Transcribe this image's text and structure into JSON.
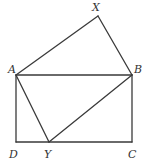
{
  "diagram": {
    "type": "geometry",
    "points": {
      "A": {
        "x": 16,
        "y": 75
      },
      "B": {
        "x": 132,
        "y": 75
      },
      "C": {
        "x": 132,
        "y": 142
      },
      "D": {
        "x": 16,
        "y": 142
      },
      "X": {
        "x": 98,
        "y": 16
      },
      "Y": {
        "x": 49,
        "y": 142
      }
    },
    "segments": [
      [
        "A",
        "B"
      ],
      [
        "B",
        "C"
      ],
      [
        "C",
        "D"
      ],
      [
        "D",
        "A"
      ],
      [
        "A",
        "X"
      ],
      [
        "X",
        "B"
      ],
      [
        "B",
        "Y"
      ],
      [
        "Y",
        "A"
      ]
    ],
    "labels": {
      "X": {
        "text": "X",
        "x": 92,
        "y": 11
      },
      "A": {
        "text": "A",
        "x": 8,
        "y": 73
      },
      "B": {
        "text": "B",
        "x": 134,
        "y": 73
      },
      "D": {
        "text": "D",
        "x": 9,
        "y": 158
      },
      "Y": {
        "text": "Y",
        "x": 44,
        "y": 158
      },
      "C": {
        "text": "C",
        "x": 128,
        "y": 158
      }
    },
    "stroke_color": "#3a3a3a",
    "label_color": "#333333"
  }
}
